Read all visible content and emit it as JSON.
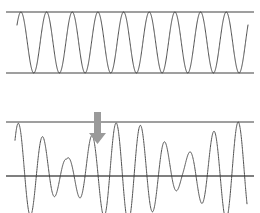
{
  "figure": {
    "width": 260,
    "height": 213,
    "background_color": "#ffffff"
  },
  "colors": {
    "wave_stroke": "#3a3a3a",
    "guide_line": "#7f7f7f",
    "guide_line_dark": "#555555",
    "arrow_fill": "#9a9a9a",
    "arrow_stroke": "#8a8a8a",
    "background": "#ffffff"
  },
  "panels": [
    {
      "id": "top-panel",
      "name": "constant-amplitude-wave-panel",
      "description": "Uniform sinusoidal oscillation of constant amplitude",
      "guide_lines": [
        {
          "name": "upper-envelope-line",
          "y": 12,
          "x_start": 6,
          "x_end": 254,
          "width": 1.6,
          "color": "#7f7f7f"
        },
        {
          "name": "lower-envelope-line",
          "y": 73,
          "x_start": 6,
          "x_end": 254,
          "width": 1.6,
          "color": "#7f7f7f"
        }
      ],
      "wave": {
        "name": "constant-amplitude-waveform",
        "style": "solid",
        "stroke_width": 0.9,
        "x_start": 17,
        "x_end": 248,
        "baseline_y": 42.5,
        "amplitude": 30.5,
        "cycles": 9.0,
        "phase_deg": 35,
        "envelope": "constant"
      }
    },
    {
      "id": "bottom-panel",
      "name": "beat-modulated-wave-panel",
      "description": "Amplitude-modulated beat waveform with a node marked by an arrow",
      "guide_lines": [
        {
          "name": "upper-envelope-line",
          "y": 122,
          "x_start": 6,
          "x_end": 254,
          "width": 1.6,
          "color": "#7f7f7f"
        },
        {
          "name": "lower-envelope-line",
          "y": 176,
          "x_start": 6,
          "x_end": 254,
          "width": 1.6,
          "color": "#555555"
        }
      ],
      "wave": {
        "name": "beat-waveform",
        "style": "dotted",
        "stroke_width": 0.9,
        "dash_pattern": "1.6 0.9",
        "x_start": 15,
        "x_end": 247,
        "baseline_y": 172,
        "amplitude": 50,
        "cycles": 9.5,
        "phase_deg": 40,
        "envelope": "beat",
        "envelope_min_ratio": 0.26,
        "envelope_cycles": 1.0,
        "envelope_phase_deg": 10,
        "node_x": 96
      },
      "annotation": {
        "name": "node-arrow",
        "direction": "down",
        "shaft_x": 94,
        "shaft_top_y": 112,
        "shaft_width": 7,
        "shaft_bottom_y": 133,
        "head_width": 17,
        "head_tip_y": 144,
        "fill": "#9a9a9a",
        "label": ""
      }
    }
  ],
  "legend": {
    "visible": false,
    "entries": []
  },
  "chart_data": {
    "type": "line",
    "xlabel": "",
    "ylabel": "",
    "grid": false,
    "legend_position": "none",
    "axis_visible": false,
    "series": [
      {
        "name": "Constant amplitude wave",
        "panel": "top-panel",
        "waveform": "sine",
        "cycles": 9.0,
        "amplitude_constant": 1.0,
        "envelope_upper": 1.0,
        "envelope_lower": -1.0,
        "x_range": [
          0,
          1
        ],
        "ylim": [
          -1.15,
          1.15
        ]
      },
      {
        "name": "Beat (amplitude-modulated) wave",
        "panel": "bottom-panel",
        "waveform": "sine with cosine envelope",
        "cycles": 9.5,
        "envelope_cycles": 1.0,
        "envelope_min_ratio": 0.26,
        "envelope_max_ratio": 1.0,
        "node_position_fraction": 0.35,
        "x_range": [
          0,
          1
        ],
        "ylim": [
          -1.15,
          1.15
        ]
      }
    ],
    "annotations": [
      {
        "type": "arrow",
        "text": "",
        "points_to": "beat node (minimum amplitude)",
        "x_fraction": 0.36,
        "direction": "down"
      }
    ]
  }
}
